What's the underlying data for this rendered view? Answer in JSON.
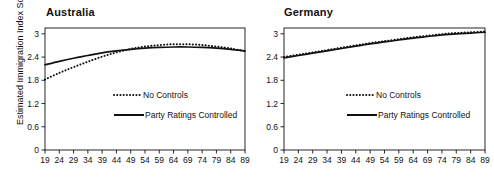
{
  "figure": {
    "width": 494,
    "height": 178,
    "background": "#ffffff",
    "ink_color": "#111111"
  },
  "axis_label": {
    "y": "Estimated Immigration Index Score"
  },
  "legend": {
    "no_controls": "No Controls",
    "party_ratings": "Party Ratings Controlled"
  },
  "chart_data": [
    {
      "type": "line",
      "title": "Australia",
      "xlabel": "",
      "ylabel": "Estimated Immigration Index Score",
      "xlim": [
        19,
        89
      ],
      "ylim": [
        0,
        3.15
      ],
      "grid": false,
      "legend_position": "center",
      "xticks": [
        19,
        24,
        29,
        34,
        39,
        44,
        49,
        54,
        59,
        64,
        69,
        74,
        79,
        84,
        89
      ],
      "xtick_labels": [
        "19",
        "24",
        "29",
        "34",
        "39",
        "44",
        "49",
        "54",
        "59",
        "64",
        "69",
        "74",
        "79",
        "84",
        "89"
      ],
      "yticks": [
        0,
        0.6,
        1.2,
        1.8,
        2.4,
        3
      ],
      "ytick_labels": [
        "0",
        "0.6",
        "1.2",
        "1.8",
        "2.4",
        "3"
      ],
      "x": [
        19,
        24,
        29,
        34,
        39,
        44,
        49,
        54,
        59,
        64,
        69,
        74,
        79,
        84,
        89
      ],
      "series": [
        {
          "name": "No Controls",
          "style": "dotted",
          "values": [
            1.82,
            1.99,
            2.14,
            2.28,
            2.41,
            2.52,
            2.61,
            2.67,
            2.71,
            2.73,
            2.73,
            2.71,
            2.67,
            2.62,
            2.55
          ]
        },
        {
          "name": "Party Ratings Controlled",
          "style": "solid",
          "values": [
            2.2,
            2.29,
            2.37,
            2.44,
            2.51,
            2.56,
            2.6,
            2.63,
            2.65,
            2.66,
            2.66,
            2.65,
            2.63,
            2.6,
            2.56
          ]
        }
      ]
    },
    {
      "type": "line",
      "title": "Germany",
      "xlabel": "",
      "ylabel": "",
      "xlim": [
        19,
        89
      ],
      "ylim": [
        0,
        3.15
      ],
      "grid": false,
      "legend_position": "center",
      "xticks": [
        19,
        24,
        29,
        34,
        39,
        44,
        49,
        54,
        59,
        64,
        69,
        74,
        79,
        84,
        89
      ],
      "xtick_labels": [
        "19",
        "24",
        "29",
        "34",
        "39",
        "44",
        "49",
        "54",
        "59",
        "64",
        "69",
        "74",
        "79",
        "84",
        "89"
      ],
      "yticks": [
        0,
        0.6,
        1.2,
        1.8,
        2.4,
        3
      ],
      "ytick_labels": [
        "0",
        "0.6",
        "1.2",
        "1.8",
        "2.4",
        "3"
      ],
      "x": [
        19,
        24,
        29,
        34,
        39,
        44,
        49,
        54,
        59,
        64,
        69,
        74,
        79,
        84,
        89
      ],
      "series": [
        {
          "name": "No Controls",
          "style": "dotted",
          "values": [
            2.4,
            2.46,
            2.52,
            2.58,
            2.64,
            2.7,
            2.76,
            2.81,
            2.86,
            2.91,
            2.95,
            2.99,
            3.02,
            3.04,
            3.06
          ]
        },
        {
          "name": "Party Ratings Controlled",
          "style": "solid",
          "values": [
            2.38,
            2.44,
            2.5,
            2.56,
            2.62,
            2.68,
            2.74,
            2.79,
            2.84,
            2.89,
            2.93,
            2.97,
            3.0,
            3.02,
            3.04
          ]
        }
      ]
    }
  ]
}
